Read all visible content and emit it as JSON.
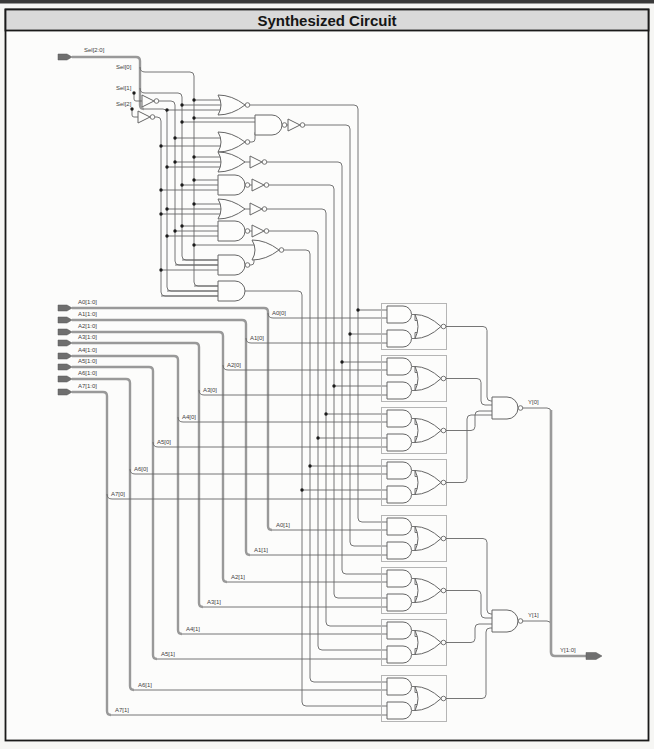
{
  "window": {
    "title": "Synthesized Circuit"
  },
  "colors": {
    "title_band": "#d9d9d9",
    "canvas": "#fcfcfb",
    "border": "#1a1a1a",
    "wire": "#666666",
    "bus": "#999999",
    "arrow_fill": "#6f6f6f",
    "junction_dot": "#1c1c1c",
    "block_outline": "#b5b5b5",
    "label_text": "#424242"
  },
  "inputs": {
    "sel_bus_label": "Sel[2:0]",
    "sel_bit_labels": [
      "Sel[0]",
      "Sel[1]",
      "Sel[2]"
    ],
    "a_bus_labels": [
      "A0[1:0]",
      "A1[1:0]",
      "A2[1:0]",
      "A3[1:0]",
      "A4[1:0]",
      "A5[1:0]",
      "A6[1:0]",
      "A7[1:0]"
    ],
    "a_bit0_labels": [
      "A0[0]",
      "A1[0]",
      "A2[0]",
      "A3[0]",
      "A4[0]",
      "A5[0]",
      "A6[0]",
      "A7[0]"
    ],
    "a_bit1_labels": [
      "A0[1]",
      "A1[1]",
      "A2[1]",
      "A3[1]",
      "A4[1]",
      "A5[1]",
      "A6[1]",
      "A7[1]"
    ]
  },
  "outputs": {
    "y_bit_labels": [
      "Y[0]",
      "Y[1]"
    ],
    "y_bus_label": "Y[1:0]"
  }
}
